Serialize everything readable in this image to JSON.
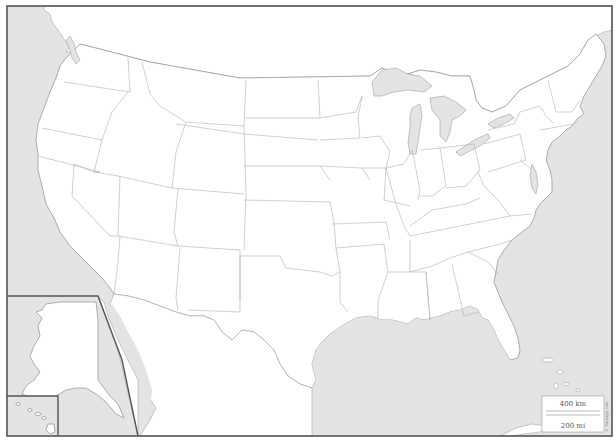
{
  "map": {
    "type": "blank outline map",
    "region": "United States",
    "insets": [
      "Alaska",
      "Hawaii"
    ],
    "colors": {
      "land": "#ffffff",
      "water": "#e4e4e4",
      "borders": "#b0b0b0",
      "frame": "#555555"
    },
    "scale_bar": {
      "km_label": "400 km",
      "mi_label": "200 mi"
    },
    "credit_text": "© Vemaps.com"
  }
}
